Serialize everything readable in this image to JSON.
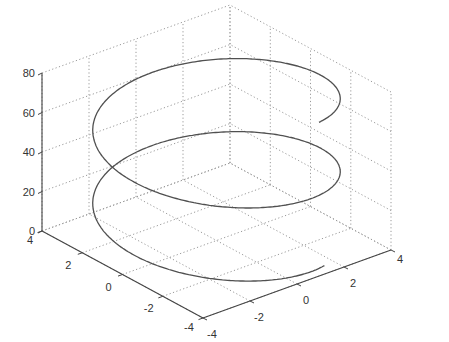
{
  "chart_data": {
    "type": "line",
    "subtype": "3d-helix",
    "title": "",
    "xlabel": "",
    "ylabel": "",
    "zlabel": "",
    "grid": true,
    "legend": null,
    "axes": {
      "left_horizontal": {
        "ticks": [
          4,
          2,
          0,
          -2,
          -4
        ],
        "range": [
          -4,
          4
        ]
      },
      "right_horizontal": {
        "ticks": [
          -4,
          -2,
          0,
          2,
          4
        ],
        "range": [
          -4,
          4
        ]
      },
      "vertical": {
        "ticks": [
          0,
          20,
          40,
          60,
          80
        ],
        "range": [
          0,
          80
        ]
      }
    },
    "series": [
      {
        "name": "helix",
        "equation": "x = 4cos(t), y = 4sin(t), z = 5.9t",
        "radius": 4,
        "z_per_turn": 37,
        "t_range": [
          0.35,
          13.0
        ],
        "z_range": [
          2,
          77
        ],
        "color": "#505050"
      }
    ],
    "tick_labels": {
      "z": [
        "0",
        "20",
        "40",
        "60",
        "80"
      ],
      "left": [
        "4",
        "2",
        "0",
        "-2",
        "-4"
      ],
      "right": [
        "-4",
        "-2",
        "0",
        "2",
        "4"
      ]
    }
  }
}
